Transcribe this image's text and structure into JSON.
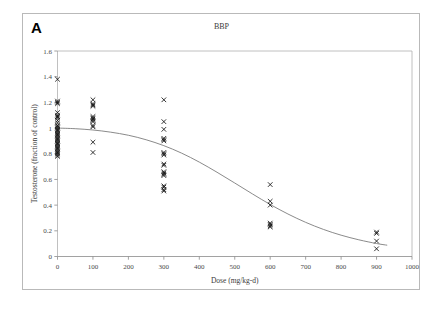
{
  "figure": {
    "panel_label": "A",
    "title": "BBP"
  },
  "chart_data": {
    "type": "scatter",
    "title": "BBP",
    "xlabel": "Dose (mg/kg-d)",
    "ylabel": "Testosterone (fraction of control)",
    "xlim": [
      0,
      1000
    ],
    "ylim": [
      0,
      1.6
    ],
    "xticks": [
      0,
      100,
      200,
      300,
      400,
      500,
      600,
      700,
      800,
      900,
      1000
    ],
    "xtick_labels": [
      "0",
      "100",
      "200",
      "300",
      "400",
      "500",
      "600",
      "700",
      "800",
      "900",
      "1000"
    ],
    "yticks": [
      0,
      0.2,
      0.4,
      0.6,
      0.8,
      1,
      1.2,
      1.4,
      1.6
    ],
    "ytick_labels": [
      "0",
      "0.2",
      "0.4",
      "0.6",
      "0.8",
      "1",
      "1.2",
      "1.4",
      "1.6"
    ],
    "grid": false,
    "legend": "none",
    "marker": "x",
    "marker_color": "#111111",
    "curve_color": "#7d7d7d",
    "series": [
      {
        "name": "Testosterone observations",
        "marker": "x",
        "points": [
          {
            "x": 0,
            "y": 1.38
          },
          {
            "x": 0,
            "y": 1.21
          },
          {
            "x": 0,
            "y": 1.2
          },
          {
            "x": 0,
            "y": 1.19
          },
          {
            "x": 0,
            "y": 1.12
          },
          {
            "x": 0,
            "y": 1.1
          },
          {
            "x": 0,
            "y": 1.09
          },
          {
            "x": 0,
            "y": 1.08
          },
          {
            "x": 0,
            "y": 1.06
          },
          {
            "x": 0,
            "y": 1.04
          },
          {
            "x": 0,
            "y": 1.02
          },
          {
            "x": 0,
            "y": 1.01
          },
          {
            "x": 0,
            "y": 1.0
          },
          {
            "x": 0,
            "y": 0.99
          },
          {
            "x": 0,
            "y": 0.98
          },
          {
            "x": 0,
            "y": 0.97
          },
          {
            "x": 0,
            "y": 0.96
          },
          {
            "x": 0,
            "y": 0.95
          },
          {
            "x": 0,
            "y": 0.94
          },
          {
            "x": 0,
            "y": 0.93
          },
          {
            "x": 0,
            "y": 0.92
          },
          {
            "x": 0,
            "y": 0.91
          },
          {
            "x": 0,
            "y": 0.9
          },
          {
            "x": 0,
            "y": 0.89
          },
          {
            "x": 0,
            "y": 0.88
          },
          {
            "x": 0,
            "y": 0.87
          },
          {
            "x": 0,
            "y": 0.86
          },
          {
            "x": 0,
            "y": 0.85
          },
          {
            "x": 0,
            "y": 0.84
          },
          {
            "x": 0,
            "y": 0.83
          },
          {
            "x": 0,
            "y": 0.82
          },
          {
            "x": 0,
            "y": 0.81
          },
          {
            "x": 0,
            "y": 0.8
          },
          {
            "x": 0,
            "y": 0.79
          },
          {
            "x": 0,
            "y": 0.78
          },
          {
            "x": 100,
            "y": 1.22
          },
          {
            "x": 100,
            "y": 1.19
          },
          {
            "x": 100,
            "y": 1.18
          },
          {
            "x": 100,
            "y": 1.17
          },
          {
            "x": 100,
            "y": 1.09
          },
          {
            "x": 100,
            "y": 1.08
          },
          {
            "x": 100,
            "y": 1.07
          },
          {
            "x": 100,
            "y": 1.06
          },
          {
            "x": 100,
            "y": 1.05
          },
          {
            "x": 100,
            "y": 1.02
          },
          {
            "x": 100,
            "y": 1.01
          },
          {
            "x": 100,
            "y": 0.89
          },
          {
            "x": 100,
            "y": 0.81
          },
          {
            "x": 300,
            "y": 1.22
          },
          {
            "x": 300,
            "y": 1.05
          },
          {
            "x": 300,
            "y": 0.99
          },
          {
            "x": 300,
            "y": 0.92
          },
          {
            "x": 300,
            "y": 0.91
          },
          {
            "x": 300,
            "y": 0.9
          },
          {
            "x": 300,
            "y": 0.81
          },
          {
            "x": 300,
            "y": 0.8
          },
          {
            "x": 300,
            "y": 0.79
          },
          {
            "x": 300,
            "y": 0.72
          },
          {
            "x": 300,
            "y": 0.71
          },
          {
            "x": 300,
            "y": 0.66
          },
          {
            "x": 300,
            "y": 0.65
          },
          {
            "x": 300,
            "y": 0.64
          },
          {
            "x": 300,
            "y": 0.63
          },
          {
            "x": 300,
            "y": 0.55
          },
          {
            "x": 300,
            "y": 0.54
          },
          {
            "x": 300,
            "y": 0.52
          },
          {
            "x": 300,
            "y": 0.51
          },
          {
            "x": 600,
            "y": 0.56
          },
          {
            "x": 600,
            "y": 0.43
          },
          {
            "x": 600,
            "y": 0.4
          },
          {
            "x": 600,
            "y": 0.26
          },
          {
            "x": 600,
            "y": 0.25
          },
          {
            "x": 600,
            "y": 0.24
          },
          {
            "x": 600,
            "y": 0.23
          },
          {
            "x": 900,
            "y": 0.19
          },
          {
            "x": 900,
            "y": 0.18
          },
          {
            "x": 900,
            "y": 0.12
          },
          {
            "x": 900,
            "y": 0.06
          }
        ]
      }
    ],
    "fit_curve": {
      "name": "Hill dose-response fit",
      "points": [
        {
          "x": 0,
          "y": 1.0
        },
        {
          "x": 50,
          "y": 0.995
        },
        {
          "x": 100,
          "y": 0.985
        },
        {
          "x": 150,
          "y": 0.968
        },
        {
          "x": 200,
          "y": 0.944
        },
        {
          "x": 250,
          "y": 0.909
        },
        {
          "x": 300,
          "y": 0.863
        },
        {
          "x": 350,
          "y": 0.805
        },
        {
          "x": 400,
          "y": 0.735
        },
        {
          "x": 450,
          "y": 0.656
        },
        {
          "x": 500,
          "y": 0.572
        },
        {
          "x": 550,
          "y": 0.487
        },
        {
          "x": 600,
          "y": 0.405
        },
        {
          "x": 650,
          "y": 0.331
        },
        {
          "x": 700,
          "y": 0.266
        },
        {
          "x": 750,
          "y": 0.211
        },
        {
          "x": 800,
          "y": 0.166
        },
        {
          "x": 850,
          "y": 0.13
        },
        {
          "x": 900,
          "y": 0.101
        },
        {
          "x": 930,
          "y": 0.088
        }
      ]
    }
  }
}
